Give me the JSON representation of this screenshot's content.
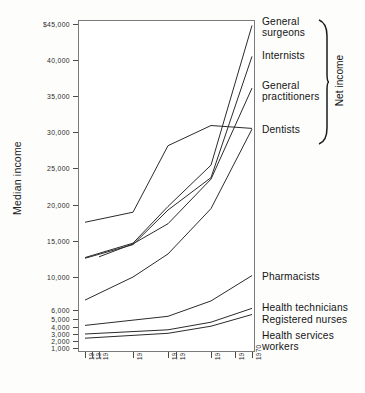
{
  "chart_data": {
    "type": "line",
    "title": "",
    "xlabel": "",
    "ylabel": "Median income",
    "x_tick_labels": [
      "1949",
      "1950",
      "1951",
      "1955",
      "1959",
      "1960",
      "1965",
      "1968",
      "1970"
    ],
    "y_tick_labels": [
      "$45,000",
      "40,000",
      "35,000",
      "30,000",
      "25,000",
      "20,000",
      "15,000",
      "10,000",
      "6,000",
      "5,000",
      "4,000",
      "3,000",
      "2,000",
      "1,000"
    ],
    "y_tick_values": [
      45000,
      40000,
      35000,
      30000,
      25000,
      20000,
      15000,
      10000,
      6000,
      5000,
      4000,
      3000,
      2000,
      1000
    ],
    "y_axis_note": "non-linear compressed scale below 10,000",
    "grid": false,
    "legend_position": "right",
    "group_label": "Net income",
    "series": [
      {
        "name": "General surgeons",
        "x": [
          "1949",
          "1955",
          "1959",
          "1965",
          "1970"
        ],
        "values": [
          12700,
          14700,
          19800,
          25400,
          44800
        ]
      },
      {
        "name": "Internists",
        "x": [
          "1949",
          "1955",
          "1959",
          "1965",
          "1970"
        ],
        "values": [
          12600,
          14500,
          19300,
          23700,
          40500
        ]
      },
      {
        "name": "General practitioners",
        "x": [
          "1951",
          "1955",
          "1959",
          "1965",
          "1970"
        ],
        "values": [
          12800,
          14600,
          17400,
          23500,
          36100
        ]
      },
      {
        "name": "Dentists",
        "x": [
          "1949",
          "1955",
          "1959",
          "1965",
          "1970"
        ],
        "values": [
          17600,
          19000,
          28100,
          30900,
          30500
        ]
      },
      {
        "name": "Pharmacists",
        "x": [
          "1949",
          "1955",
          "1959",
          "1965",
          "1970"
        ],
        "values": [
          7200,
          10000,
          13200,
          19500,
          30400
        ]
      },
      {
        "name": "Health technicians",
        "x": [
          "1949",
          "1959",
          "1965",
          "1970"
        ],
        "values": [
          4200,
          5300,
          7100,
          10200
        ]
      },
      {
        "name": "Registered nurses",
        "x": [
          "1949",
          "1959",
          "1965",
          "1970"
        ],
        "values": [
          3000,
          3600,
          4600,
          6200
        ]
      },
      {
        "name": "Health services workers",
        "x": [
          "1949",
          "1959",
          "1965",
          "1970"
        ],
        "values": [
          2400,
          3100,
          4100,
          5500
        ]
      }
    ]
  },
  "axis": {
    "y_title": "Median income"
  },
  "labels": {
    "general_surgeons": "General\nsurgeons",
    "internists": "Internists",
    "general_practitioners": "General\npractitioners",
    "dentists": "Dentists",
    "pharmacists": "Pharmacists",
    "health_technicians": "Health technicians",
    "registered_nurses": "Registered nurses",
    "health_services_workers": "Health services\nworkers",
    "net_income": "Net income"
  },
  "yticks": [
    {
      "label": "$45,000",
      "y": 24
    },
    {
      "label": "40,000",
      "y": 60
    },
    {
      "label": "35,000",
      "y": 96
    },
    {
      "label": "30,000",
      "y": 132
    },
    {
      "label": "25,000",
      "y": 168
    },
    {
      "label": "20,000",
      "y": 205
    },
    {
      "label": "15,000",
      "y": 241
    },
    {
      "label": "10,000",
      "y": 277
    },
    {
      "label": "6,000",
      "y": 310
    },
    {
      "label": "5,000",
      "y": 319
    },
    {
      "label": "4,000",
      "y": 327
    },
    {
      "label": "3,000",
      "y": 334
    },
    {
      "label": "2,000",
      "y": 341
    },
    {
      "label": "1,000",
      "y": 348
    }
  ],
  "xticks": [
    {
      "label": "1949",
      "x": 85
    },
    {
      "label": "1950",
      "x": 92
    },
    {
      "label": "1951",
      "x": 99
    },
    {
      "label": "1955",
      "x": 133
    },
    {
      "label": "1959",
      "x": 168
    },
    {
      "label": "1960",
      "x": 176
    },
    {
      "label": "1965",
      "x": 211
    },
    {
      "label": "1968",
      "x": 235
    },
    {
      "label": "1970",
      "x": 252
    }
  ]
}
